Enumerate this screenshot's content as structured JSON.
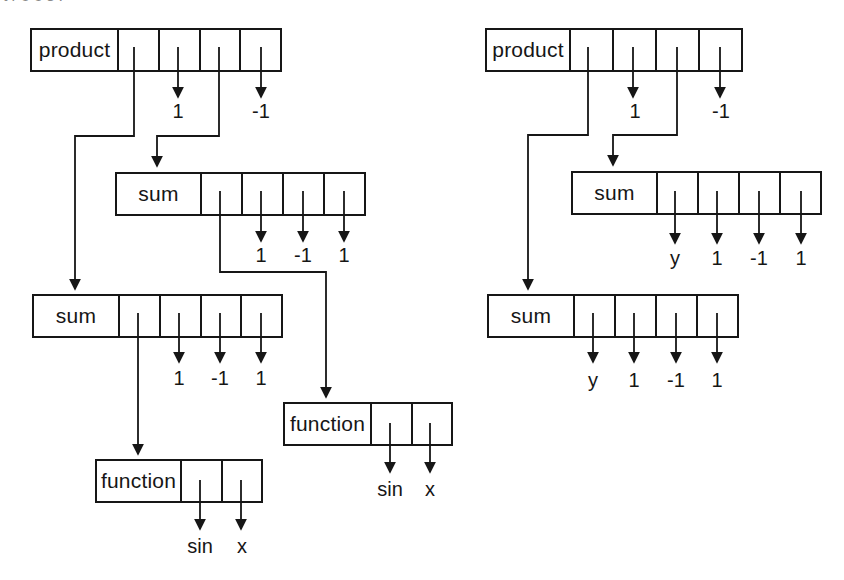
{
  "figure": {
    "ink_color": "#161616",
    "background_color": "#ffffff",
    "top_edge_fragment": "trees."
  },
  "trees": {
    "left": {
      "product": {
        "label": "product",
        "leaves": [
          "1",
          "-1"
        ]
      },
      "sum_upper": {
        "label": "sum",
        "leaves": [
          "1",
          "-1",
          "1"
        ]
      },
      "sum_lower": {
        "label": "sum",
        "leaves": [
          "1",
          "-1",
          "1"
        ]
      },
      "function_right": {
        "label": "function",
        "leaves": [
          "sin",
          "x"
        ]
      },
      "function_left": {
        "label": "function",
        "leaves": [
          "sin",
          "x"
        ]
      }
    },
    "right": {
      "product": {
        "label": "product",
        "leaves": [
          "1",
          "-1"
        ]
      },
      "sum_upper": {
        "label": "sum",
        "leaves": [
          "y",
          "1",
          "-1",
          "1"
        ]
      },
      "sum_lower": {
        "label": "sum",
        "leaves": [
          "y",
          "1",
          "-1",
          "1"
        ]
      }
    }
  }
}
